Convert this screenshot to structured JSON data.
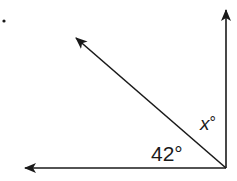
{
  "diagram": {
    "type": "angle-diagram",
    "vertex": {
      "x": 226,
      "y": 168
    },
    "rays": [
      {
        "name": "vertical-ray",
        "direction": "up",
        "end": {
          "x": 226,
          "y": 10
        }
      },
      {
        "name": "horizontal-ray",
        "direction": "left",
        "end": {
          "x": 25,
          "y": 168
        }
      },
      {
        "name": "diagonal-ray",
        "direction": "up-left",
        "end": {
          "x": 76,
          "y": 38
        }
      }
    ],
    "labels": {
      "known_angle": "42°",
      "unknown_angle_var": "x",
      "unknown_angle_deg": "°"
    },
    "angles": [
      {
        "between": [
          "horizontal-ray",
          "diagonal-ray"
        ],
        "value": 42,
        "label": "42°"
      },
      {
        "between": [
          "diagonal-ray",
          "vertical-ray"
        ],
        "value": "x",
        "label": "x°"
      }
    ],
    "right_angle_total": 90,
    "colors": {
      "stroke": "#1a1a1a",
      "background": "#ffffff"
    }
  }
}
